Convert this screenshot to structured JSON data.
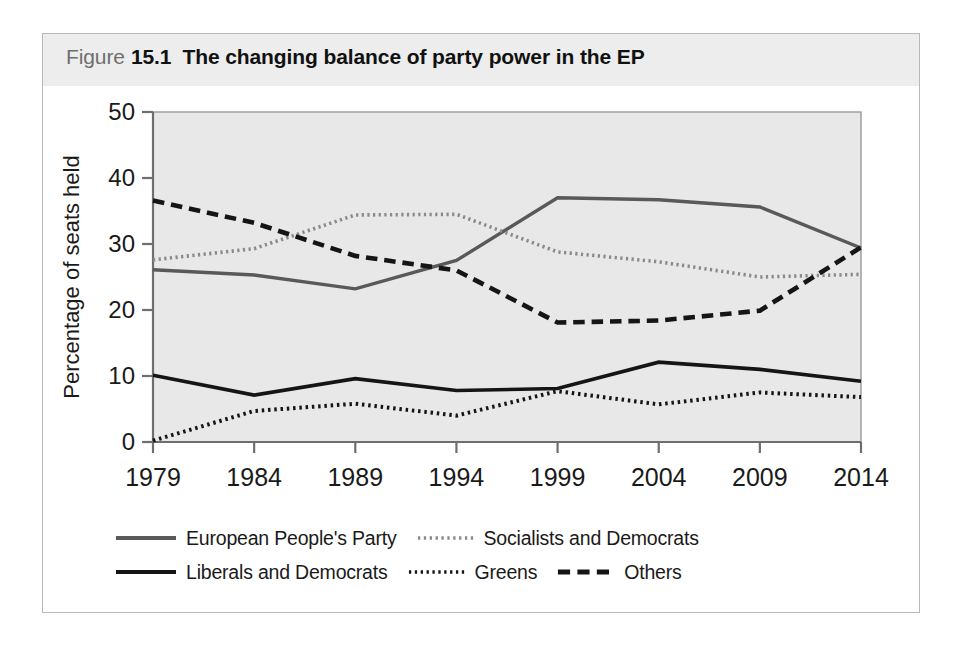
{
  "figure": {
    "caption_word": "Figure",
    "caption_number": "15.1",
    "caption_title": "The changing balance of party power in the EP"
  },
  "legend": {
    "rows": [
      [
        {
          "label": "European People's Party",
          "style": "solid",
          "color": "#595959",
          "icon": "line-swatch-solid-gray"
        },
        {
          "label": "Socialists and Democrats",
          "style": "dotted",
          "color": "#8a8a8a",
          "icon": "line-swatch-dotted-gray"
        }
      ],
      [
        {
          "label": "Liberals and Democrats",
          "style": "solid",
          "color": "#151515",
          "icon": "line-swatch-solid-black"
        },
        {
          "label": "Greens",
          "style": "dotted",
          "color": "#151515",
          "icon": "line-swatch-dotted-black"
        },
        {
          "label": "Others",
          "style": "dashed",
          "color": "#151515",
          "icon": "line-swatch-dashed-black"
        }
      ]
    ]
  },
  "chart_data": {
    "type": "line",
    "title": "The changing balance of party power in the EP",
    "xlabel": "",
    "ylabel": "Percentage of seats held",
    "x": [
      1979,
      1984,
      1989,
      1994,
      1999,
      2004,
      2009,
      2014
    ],
    "categories": [
      "1979",
      "1984",
      "1989",
      "1994",
      "1999",
      "2004",
      "2009",
      "2014"
    ],
    "xlim": [
      1979,
      2014
    ],
    "ylim": [
      0,
      50
    ],
    "yticks": [
      0,
      10,
      20,
      30,
      40,
      50
    ],
    "ytick_labels": [
      "0",
      "10",
      "20",
      "30",
      "40",
      "50"
    ],
    "grid": false,
    "legend_position": "below",
    "plot_background": "#e8e8e8",
    "series": [
      {
        "name": "European People's Party",
        "style": "solid",
        "color": "#595959",
        "width": 3.4,
        "values": [
          26.1,
          25.3,
          23.2,
          27.5,
          37.0,
          36.7,
          35.6,
          29.4
        ]
      },
      {
        "name": "Socialists and Democrats",
        "style": "dotted",
        "color": "#8a8a8a",
        "width": 3.6,
        "values": [
          27.6,
          29.3,
          34.4,
          34.5,
          28.8,
          27.3,
          25.0,
          25.4
        ]
      },
      {
        "name": "Liberals and Democrats",
        "style": "solid",
        "color": "#151515",
        "width": 3.6,
        "values": [
          10.1,
          7.1,
          9.6,
          7.8,
          8.1,
          12.1,
          11.0,
          9.2
        ]
      },
      {
        "name": "Greens",
        "style": "dotted",
        "color": "#151515",
        "width": 4.0,
        "values": [
          0.2,
          4.7,
          5.8,
          4.0,
          7.7,
          5.7,
          7.5,
          6.8
        ]
      },
      {
        "name": "Others",
        "style": "dashed",
        "color": "#151515",
        "width": 4.6,
        "values": [
          36.6,
          33.2,
          28.2,
          26.0,
          18.1,
          18.4,
          19.9,
          29.5
        ]
      }
    ]
  }
}
